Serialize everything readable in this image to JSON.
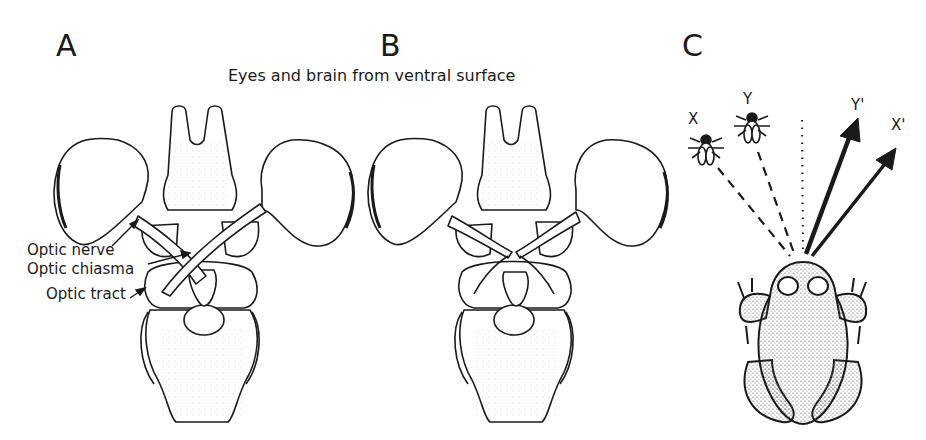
{
  "panels": {
    "a": {
      "letter": "A"
    },
    "b": {
      "letter": "B"
    },
    "c": {
      "letter": "C"
    }
  },
  "caption": "Eyes and brain from ventral surface",
  "labels": {
    "optic_nerve": "Optic nerve",
    "optic_chiasma": "Optic chiasma",
    "optic_tract": "Optic tract"
  },
  "targets": {
    "x": "X",
    "y": "Y",
    "x_prime": "X'",
    "y_prime": "Y'"
  },
  "colors": {
    "ink": "#1a1a1a",
    "background": "#ffffff",
    "stipple": "#777777"
  }
}
